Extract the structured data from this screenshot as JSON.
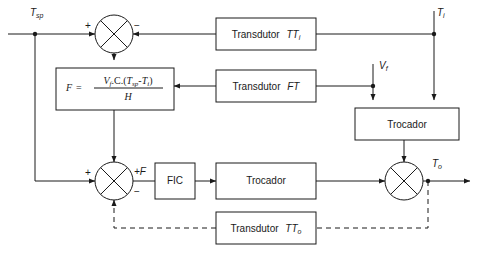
{
  "diagram": {
    "language": "pt-BR",
    "stroke_color": "#1a1a1a",
    "background_color": "#ffffff",
    "blocks": [
      {
        "id": "transdutor_tti",
        "label": "Transdutor",
        "tag": "TT",
        "tag_sub": "i",
        "x": 216,
        "y": 18,
        "w": 100,
        "h": 32
      },
      {
        "id": "formula",
        "label": "F",
        "x": 56,
        "y": 68,
        "w": 118,
        "h": 42
      },
      {
        "id": "transdutor_ft",
        "label": "Transdutor",
        "tag": "FT",
        "tag_sub": "",
        "x": 216,
        "y": 70,
        "w": 100,
        "h": 32
      },
      {
        "id": "trocador_top",
        "label": "Trocador",
        "tag": "",
        "tag_sub": "",
        "x": 355,
        "y": 108,
        "w": 104,
        "h": 32
      },
      {
        "id": "fic",
        "label": "FIC",
        "tag": "",
        "tag_sub": "",
        "x": 155,
        "y": 163,
        "w": 40,
        "h": 36
      },
      {
        "id": "trocador_bottom",
        "label": "Trocador",
        "tag": "",
        "tag_sub": "",
        "x": 216,
        "y": 163,
        "w": 100,
        "h": 36
      },
      {
        "id": "transdutor_tto",
        "label": "Transdutor",
        "tag": "TT",
        "tag_sub": "o",
        "x": 216,
        "y": 212,
        "w": 100,
        "h": 32
      }
    ],
    "formula": {
      "lhs": "F",
      "equals": "=",
      "numerator_parts": [
        "V",
        "f",
        ".C.(",
        "T",
        "sp",
        "-",
        "T",
        "i",
        ")"
      ],
      "numerator_plain": "Vf.C.(Tsp-Ti)",
      "denominator": "H"
    },
    "summing_junctions": [
      {
        "id": "sum_top",
        "cx": 114,
        "cy": 34,
        "r": 19,
        "signs": [
          {
            "text": "+",
            "x": 87,
            "y": 26
          },
          {
            "text": "−",
            "x": 136,
            "y": 26
          }
        ]
      },
      {
        "id": "sum_bottom_left",
        "cx": 114,
        "cy": 181,
        "r": 19,
        "signs": [
          {
            "text": "+",
            "x": 87,
            "y": 173
          },
          {
            "text": "−",
            "x": 136,
            "y": 191
          }
        ]
      },
      {
        "id": "sum_right",
        "cx": 404,
        "cy": 181,
        "r": 19,
        "signs": []
      }
    ],
    "signal_labels": [
      {
        "id": "t_sp",
        "base": "T",
        "sub": "sp",
        "x": 32,
        "y": 13
      },
      {
        "id": "t_i",
        "base": "T",
        "sub": "i",
        "x": 439,
        "y": 13
      },
      {
        "id": "v_f",
        "base": "V",
        "sub": "f",
        "x": 337,
        "y": 66
      },
      {
        "id": "plus_f",
        "base": "+F",
        "sub": "",
        "x": 136,
        "y": 173
      },
      {
        "id": "t_o",
        "base": "T",
        "sub": "o",
        "x": 430,
        "y": 164
      }
    ],
    "junction_dots": [
      {
        "id": "dot-tsp",
        "cx": 35,
        "cy": 34
      },
      {
        "id": "dot-ti",
        "cx": 434,
        "cy": 34
      },
      {
        "id": "dot-vf",
        "cx": 373,
        "cy": 86
      },
      {
        "id": "dot-to",
        "cx": 428,
        "cy": 181
      }
    ],
    "notes": {
      "dashed_paths": "feedback from T_o through Transdutor TT_o back to lower summing junction",
      "solid_paths": "forward and feedforward signal paths"
    }
  }
}
